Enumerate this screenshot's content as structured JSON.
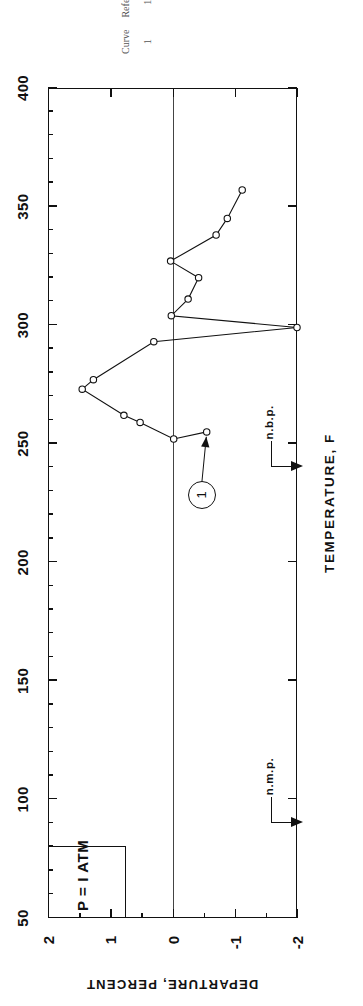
{
  "figure": {
    "condition_label": "P = I ATM",
    "curve_balloon": "1"
  },
  "axes": {
    "x_title_top": "TEMPERATURE, K",
    "x_title_bottom": "TEMPERATURE, F",
    "y_title": "DEPARTURE, PERCENT",
    "x_ticks": [
      "50",
      "100",
      "150",
      "200",
      "250",
      "300",
      "350",
      "400"
    ],
    "y_ticks": [
      "2",
      "1",
      "0",
      "-1",
      "-2"
    ]
  },
  "annotations": {
    "nmp": "n.m.p.",
    "nbp": "n.b.p."
  },
  "reference": {
    "col_curve": "Curve",
    "col_reference": "Reference",
    "rows": [
      {
        "curve": "1",
        "reference": "137"
      }
    ]
  },
  "chart_data": {
    "type": "line",
    "title": "",
    "xlabel": "TEMPERATURE, K",
    "ylabel": "DEPARTURE, PERCENT",
    "xlim": [
      50,
      400
    ],
    "ylim": [
      -2,
      2
    ],
    "grid": false,
    "legend": "none",
    "annotations": [
      {
        "text": "P = I ATM",
        "type": "box"
      },
      {
        "text": "n.m.p.",
        "x": 90,
        "y": -2
      },
      {
        "text": "n.b.p.",
        "x": 240,
        "y": -2
      },
      {
        "text": "1",
        "type": "curve-balloon",
        "x": 228,
        "y": -0.45
      }
    ],
    "series": [
      {
        "name": "1",
        "marker": "open-circle",
        "points": [
          {
            "x": 255,
            "y": -0.55
          },
          {
            "x": 252,
            "y": -0.02
          },
          {
            "x": 259,
            "y": 0.52
          },
          {
            "x": 262,
            "y": 0.78
          },
          {
            "x": 273,
            "y": 1.45
          },
          {
            "x": 277,
            "y": 1.27
          },
          {
            "x": 293,
            "y": 0.3
          },
          {
            "x": 299,
            "y": -2.0
          },
          {
            "x": 304,
            "y": 0.02
          },
          {
            "x": 311,
            "y": -0.25
          },
          {
            "x": 320,
            "y": -0.42
          },
          {
            "x": 327,
            "y": 0.03
          },
          {
            "x": 338,
            "y": -0.7
          },
          {
            "x": 345,
            "y": -0.88
          },
          {
            "x": 357,
            "y": -1.12
          }
        ]
      }
    ]
  }
}
